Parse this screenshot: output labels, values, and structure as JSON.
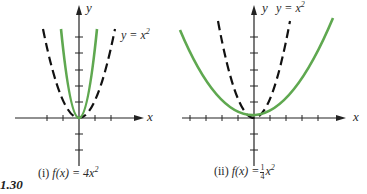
{
  "figure_label": "1.30",
  "colors": {
    "axis": "#222222",
    "reference_curve": "#111111",
    "transformed_curve": "#5fa850"
  },
  "panels": [
    {
      "id": "i",
      "caption_prefix": "(i)",
      "caption_func": "f(x) = 4x",
      "caption_exp": "2",
      "x_axis_label": "x",
      "y_axis_label": "y",
      "reference_label_lhs": "y = x",
      "reference_label_exp": "2",
      "reference_function": "y = x^2",
      "transformed_function": "f(x) = 4x^2"
    },
    {
      "id": "ii",
      "caption_prefix": "(ii)",
      "caption_func_lhs": "f(x) =",
      "caption_frac_num": "1",
      "caption_frac_den": "4",
      "caption_var": "x",
      "caption_exp": "2",
      "x_axis_label": "x",
      "y_axis_label": "y",
      "reference_label_lhs": "y = x",
      "reference_label_exp": "2",
      "reference_function": "y = x^2",
      "transformed_function": "f(x) = (1/4)x^2"
    }
  ]
}
